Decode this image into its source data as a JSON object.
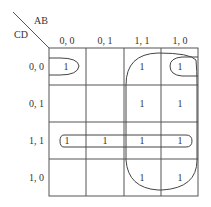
{
  "kmap": {
    "row_var": "CD",
    "col_var": "AB",
    "col_labels": [
      "0, 0",
      "0, 1",
      "1, 1",
      "1, 0"
    ],
    "row_labels": [
      "0, 0",
      "0, 1",
      "1, 1",
      "1, 0"
    ],
    "cells": [
      [
        "1",
        "",
        "1",
        "1"
      ],
      [
        "",
        "",
        "1",
        "1"
      ],
      [
        "1",
        "1",
        "1",
        "1"
      ],
      [
        "",
        "",
        "1",
        "1"
      ]
    ],
    "groupings": [
      {
        "name": "corner-wrap-group",
        "cells": "rows 0, cols 0 & 3 (wraps horizontally)"
      },
      {
        "name": "row-11-group",
        "cells": "row 2 all columns"
      },
      {
        "name": "columns-11-10-group",
        "cells": "cols 2-3 all rows"
      }
    ]
  }
}
